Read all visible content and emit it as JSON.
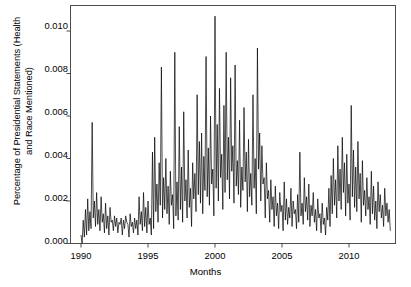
{
  "chart_data": {
    "type": "line",
    "title": "",
    "xlabel": "Months",
    "ylabel": "Percentage of Presidential Statements (Health\nand Race Mentioned)",
    "xlim": [
      1990.0,
      1913.0
    ],
    "ylim": [
      0.0,
      0.0112
    ],
    "xticks": [
      1990,
      1995,
      2000,
      2005,
      2010
    ],
    "xtick_labels": [
      "1990",
      "1995",
      "2000",
      "2005",
      "2010"
    ],
    "yticks": [
      0.0,
      0.002,
      0.004,
      0.006,
      0.008,
      0.01
    ],
    "ytick_labels": [
      "0.000",
      "0.002",
      "0.004",
      "0.006",
      "0.008",
      "0.010"
    ],
    "grid": false,
    "legend": null,
    "line_color": "#000000",
    "line_width": 0.7,
    "series_name": "Percentage of Presidential Statements (Health and Race Mentioned)",
    "x_start": 1990.0,
    "x_step": 0.0833333,
    "n_points": 276,
    "values": [
      0.0004,
      0.0,
      0.0011,
      0.0003,
      0.0016,
      0.0004,
      0.0021,
      0.0006,
      0.0015,
      0.0007,
      0.0057,
      0.0012,
      0.002,
      0.0008,
      0.0024,
      0.0009,
      0.0016,
      0.0006,
      0.0022,
      0.001,
      0.0014,
      0.0005,
      0.0019,
      0.0007,
      0.0013,
      0.0004,
      0.0017,
      0.001,
      0.0011,
      0.0006,
      0.0013,
      0.0008,
      0.0012,
      0.0005,
      0.001,
      0.0009,
      0.0012,
      0.0004,
      0.0011,
      0.0007,
      0.0013,
      0.001,
      0.0009,
      0.0003,
      0.0014,
      0.0008,
      0.001,
      0.0005,
      0.0012,
      0.0007,
      0.0011,
      0.0004,
      0.0022,
      0.0009,
      0.0015,
      0.0006,
      0.0024,
      0.0008,
      0.0017,
      0.0005,
      0.002,
      0.0009,
      0.0012,
      0.0004,
      0.0043,
      0.0007,
      0.005,
      0.0015,
      0.0028,
      0.001,
      0.0038,
      0.0018,
      0.0083,
      0.0012,
      0.0031,
      0.0016,
      0.004,
      0.0014,
      0.0027,
      0.0009,
      0.0034,
      0.0018,
      0.0023,
      0.0007,
      0.009,
      0.0013,
      0.0029,
      0.0011,
      0.0055,
      0.0016,
      0.0036,
      0.001,
      0.0062,
      0.002,
      0.003,
      0.0012,
      0.0044,
      0.0017,
      0.0026,
      0.0008,
      0.0038,
      0.0021,
      0.0033,
      0.0015,
      0.007,
      0.0023,
      0.0048,
      0.0019,
      0.0052,
      0.0014,
      0.0041,
      0.0025,
      0.0088,
      0.0022,
      0.0045,
      0.0018,
      0.006,
      0.0028,
      0.0035,
      0.0013,
      0.0107,
      0.0026,
      0.0056,
      0.002,
      0.0073,
      0.0031,
      0.0042,
      0.0016,
      0.0065,
      0.0024,
      0.009,
      0.003,
      0.005,
      0.0021,
      0.0078,
      0.0034,
      0.0046,
      0.0019,
      0.0084,
      0.0027,
      0.0039,
      0.0023,
      0.0058,
      0.0017,
      0.0036,
      0.0025,
      0.0064,
      0.0029,
      0.0043,
      0.0015,
      0.0049,
      0.0022,
      0.0033,
      0.0018,
      0.007,
      0.0026,
      0.004,
      0.0014,
      0.0092,
      0.0035,
      0.0052,
      0.002,
      0.0046,
      0.0028,
      0.0031,
      0.0012,
      0.0038,
      0.0021,
      0.0025,
      0.001,
      0.003,
      0.0016,
      0.0022,
      0.0008,
      0.0027,
      0.0013,
      0.0019,
      0.0007,
      0.0024,
      0.0015,
      0.0018,
      0.0006,
      0.0029,
      0.0011,
      0.0021,
      0.0009,
      0.0017,
      0.0012,
      0.0026,
      0.0008,
      0.002,
      0.0014,
      0.0016,
      0.0007,
      0.0023,
      0.001,
      0.0043,
      0.0013,
      0.0019,
      0.0009,
      0.0031,
      0.0015,
      0.0022,
      0.0011,
      0.0028,
      0.0008,
      0.0018,
      0.0013,
      0.0024,
      0.001,
      0.0016,
      0.0006,
      0.0021,
      0.0012,
      0.0014,
      0.0005,
      0.0019,
      0.0009,
      0.0012,
      0.0004,
      0.0017,
      0.0011,
      0.0026,
      0.0008,
      0.0032,
      0.0014,
      0.004,
      0.0018,
      0.003,
      0.0012,
      0.0046,
      0.002,
      0.0035,
      0.0016,
      0.005,
      0.0024,
      0.0038,
      0.0013,
      0.0042,
      0.0019,
      0.0028,
      0.0011,
      0.0065,
      0.0022,
      0.0044,
      0.0017,
      0.0036,
      0.0015,
      0.0048,
      0.0021,
      0.0033,
      0.001,
      0.0039,
      0.0018,
      0.0025,
      0.0013,
      0.0031,
      0.0016,
      0.0022,
      0.0009,
      0.0034,
      0.0014,
      0.0027,
      0.0011,
      0.002,
      0.0007,
      0.0029,
      0.0015,
      0.0023,
      0.0012,
      0.0018,
      0.0008,
      0.0026,
      0.0013,
      0.0019,
      0.001,
      0.0016,
      0.0006
    ]
  },
  "axis": {
    "frame_color": "#4d4d4d",
    "tick_color": "#4d4d4d"
  }
}
